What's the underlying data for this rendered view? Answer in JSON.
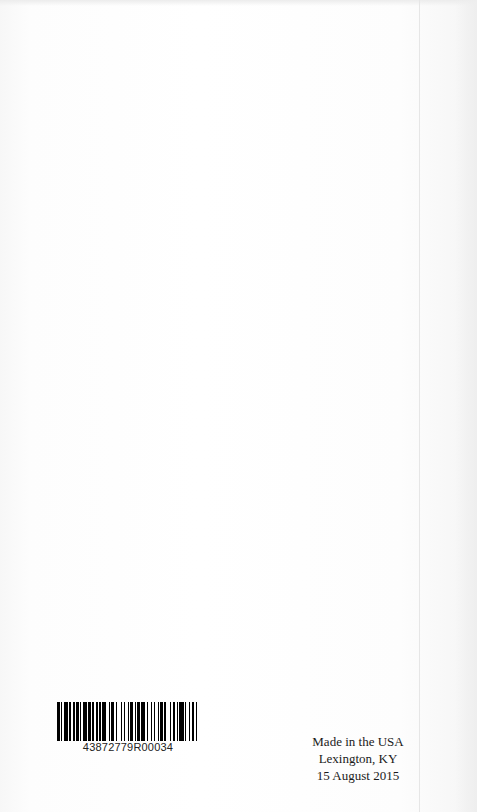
{
  "page": {
    "type": "book-back-page",
    "background_color": "#ffffff"
  },
  "barcode": {
    "number": "43872779R00034",
    "bar_color": "#000000",
    "pattern": [
      2,
      1,
      1,
      1,
      3,
      1,
      1,
      2,
      1,
      1,
      2,
      1,
      1,
      1,
      3,
      1,
      2,
      1,
      1,
      2,
      1,
      1,
      1,
      1,
      3,
      2,
      1,
      1,
      2,
      1,
      1,
      3,
      1,
      1,
      1,
      2,
      1,
      1,
      2,
      1,
      1,
      1,
      2,
      1,
      3,
      1,
      1,
      2,
      1,
      1,
      1,
      2,
      1,
      1,
      2,
      1,
      1,
      3,
      1,
      1,
      2,
      1,
      1,
      1,
      3,
      1,
      1,
      2,
      1,
      1,
      2,
      1,
      1,
      1
    ]
  },
  "imprint": {
    "line1": "Made in the USA",
    "line2": "Lexington, KY",
    "line3": "15 August 2015"
  }
}
